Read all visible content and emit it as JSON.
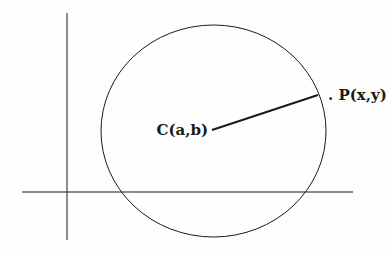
{
  "diagram": {
    "title": "",
    "center_label": "C(a,b)",
    "point_label": ". P(x,y)",
    "colors": {
      "stroke": "#1a1a1a",
      "background": "#ffffff"
    },
    "geometry": {
      "x_axis": {
        "x1": 22,
        "y1": 192,
        "x2": 353,
        "y2": 192
      },
      "y_axis": {
        "x1": 67,
        "y1": 13,
        "x2": 67,
        "y2": 240
      },
      "circle": {
        "cx": 213.5,
        "cy": 131,
        "rx": 112.5,
        "ry": 106
      },
      "radius": {
        "x1": 212,
        "y1": 130,
        "x2": 318,
        "y2": 95
      }
    }
  }
}
